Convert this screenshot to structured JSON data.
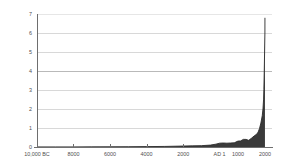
{
  "chart_data": {
    "type": "area",
    "title": "",
    "xlabel": "",
    "ylabel": "World population, billions",
    "ylim": [
      0,
      7
    ],
    "xlim": [
      -10000,
      2000
    ],
    "grid": true,
    "legend": null,
    "fill_color": "#3a3a3a",
    "line_color": "#2b2b2b",
    "grid_color": "#d8d8d8",
    "axis_color": "#6e6e6e",
    "background": "#ffffff",
    "y_ticks": [
      "0",
      "1",
      "2",
      "3",
      "4",
      "5",
      "6",
      "7"
    ],
    "y_tick_values": [
      0,
      1,
      2,
      3,
      4,
      5,
      6,
      7
    ],
    "x_ticks": [
      {
        "label": "10,000 BC",
        "value": -10000,
        "pos_pct": 0
      },
      {
        "label": "8000",
        "value": -8000,
        "pos_pct": 15.5
      },
      {
        "label": "6000",
        "value": -6000,
        "pos_pct": 31.1
      },
      {
        "label": "4000",
        "value": -4000,
        "pos_pct": 46.6
      },
      {
        "label": "2000",
        "value": -2000,
        "pos_pct": 62.2
      },
      {
        "label": "AD 1",
        "value": 1,
        "pos_pct": 77.7
      },
      {
        "label": "1000",
        "value": 1000,
        "pos_pct": 85.5
      },
      {
        "label": "2000",
        "value": 2000,
        "pos_pct": 97.0
      }
    ],
    "x": [
      -10000,
      -9000,
      -8000,
      -7000,
      -6000,
      -5000,
      -4000,
      -3000,
      -2000,
      -1500,
      -1000,
      -500,
      -200,
      1,
      200,
      400,
      600,
      800,
      1000,
      1100,
      1200,
      1300,
      1400,
      1500,
      1600,
      1700,
      1750,
      1800,
      1850,
      1900,
      1927,
      1950,
      1960,
      1974,
      1987,
      1999,
      2000
    ],
    "values": [
      0.004,
      0.005,
      0.005,
      0.007,
      0.01,
      0.015,
      0.02,
      0.03,
      0.05,
      0.06,
      0.07,
      0.1,
      0.15,
      0.2,
      0.21,
      0.2,
      0.21,
      0.22,
      0.31,
      0.32,
      0.4,
      0.4,
      0.35,
      0.46,
      0.58,
      0.68,
      0.79,
      0.98,
      1.26,
      1.65,
      2.0,
      2.52,
      3.02,
      4.0,
      5.0,
      6.0,
      6.8
    ],
    "series": [
      {
        "name": "World population",
        "values": [
          0.004,
          0.005,
          0.005,
          0.007,
          0.01,
          0.015,
          0.02,
          0.03,
          0.05,
          0.06,
          0.07,
          0.1,
          0.15,
          0.2,
          0.21,
          0.2,
          0.21,
          0.22,
          0.31,
          0.32,
          0.4,
          0.4,
          0.35,
          0.46,
          0.58,
          0.68,
          0.79,
          0.98,
          1.26,
          1.65,
          2.0,
          2.52,
          3.02,
          4.0,
          5.0,
          6.0,
          6.8
        ]
      }
    ]
  }
}
